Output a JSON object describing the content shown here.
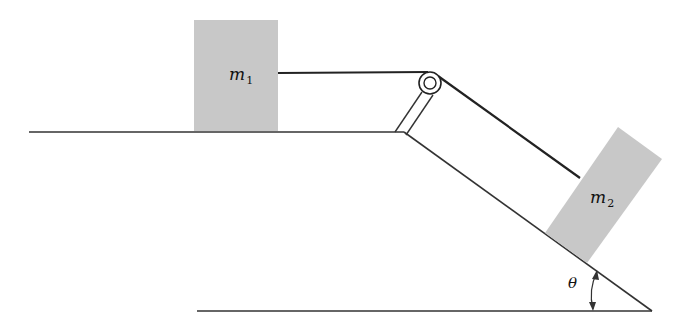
{
  "diagram": {
    "colors": {
      "block_fill": "#c8c8c8",
      "line": "#222222",
      "background": "#ffffff"
    },
    "block1": {
      "label": "m",
      "subscript": "1"
    },
    "block2": {
      "label": "m",
      "subscript": "2"
    },
    "angle": {
      "label": "θ"
    },
    "pulley": {
      "name": "pulley"
    },
    "rope": {
      "name": "rope"
    }
  }
}
